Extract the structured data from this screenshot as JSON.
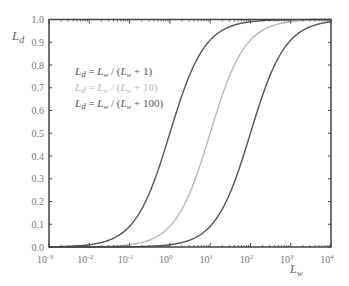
{
  "chart_data": {
    "type": "line",
    "title": "",
    "xlabel": "L_w",
    "ylabel": "L_d",
    "xscale": "log",
    "xlim": [
      0.001,
      10000
    ],
    "ylim": [
      0.0,
      1.0
    ],
    "x_ticks": [
      "10-3",
      "10-2",
      "10-1",
      "100",
      "101",
      "102",
      "103",
      "104"
    ],
    "x_tick_exponents": [
      -3,
      -2,
      -1,
      0,
      1,
      2,
      3,
      4
    ],
    "y_ticks": [
      "0.0",
      "0.1",
      "0.2",
      "0.3",
      "0.4",
      "0.5",
      "0.6",
      "0.7",
      "0.8",
      "0.9",
      "1.0"
    ],
    "grid": false,
    "legend_position": "upper-left-inside",
    "series": [
      {
        "name": "L_d = L_w / (L_w + 1)",
        "k": 1,
        "color": "#555555",
        "x": [
          0.001,
          0.01,
          0.1,
          1,
          10,
          100,
          1000,
          10000
        ],
        "values": [
          0.001,
          0.0099,
          0.0909,
          0.5,
          0.9091,
          0.9901,
          0.999,
          0.9999
        ]
      },
      {
        "name": "L_d = L_w / (L_w + 10)",
        "k": 10,
        "color": "#b8b8b8",
        "x": [
          0.001,
          0.01,
          0.1,
          1,
          10,
          100,
          1000,
          10000
        ],
        "values": [
          0.0001,
          0.001,
          0.0099,
          0.0909,
          0.5,
          0.9091,
          0.9901,
          0.999
        ]
      },
      {
        "name": "L_d = L_w / (L_w + 100)",
        "k": 100,
        "color": "#555555",
        "x": [
          0.001,
          0.01,
          0.1,
          1,
          10,
          100,
          1000,
          10000
        ],
        "values": [
          1e-05,
          0.0001,
          0.001,
          0.0099,
          0.0909,
          0.5,
          0.9091,
          0.9901
        ]
      }
    ]
  },
  "legend": [
    {
      "lhs": "L",
      "lhs_sub": "d",
      "eq": " = ",
      "num": "L",
      "num_sub": "w",
      "mid": " / (",
      "den": "L",
      "den_sub": "w",
      "tail": " + 1)",
      "color": "#555555"
    },
    {
      "lhs": "L",
      "lhs_sub": "d",
      "eq": " = ",
      "num": "L",
      "num_sub": "w",
      "mid": " / (",
      "den": "L",
      "den_sub": "w",
      "tail": " + 10)",
      "color": "#b8b8b8"
    },
    {
      "lhs": "L",
      "lhs_sub": "d",
      "eq": " = ",
      "num": "L",
      "num_sub": "w",
      "mid": " / (",
      "den": "L",
      "den_sub": "w",
      "tail": " + 100)",
      "color": "#555555"
    }
  ],
  "axis_labels": {
    "y_main": "L",
    "y_sub": "d",
    "x_main": "L",
    "x_sub": "w"
  }
}
